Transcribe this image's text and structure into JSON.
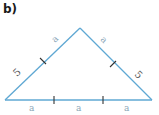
{
  "figure": {
    "part_label": "b)",
    "colors": {
      "line": "#5fa8d3",
      "tick": "#333333",
      "label_a": "#8aa6b8",
      "label_5": "#555555"
    },
    "triangle": {
      "apex": [
        80,
        28
      ],
      "base_left": [
        5,
        100
      ],
      "base_right": [
        152,
        100
      ]
    },
    "labels": {
      "left_upper": "a",
      "left_lower": "5",
      "right_upper": "a",
      "right_lower": "5",
      "base_left": "a",
      "base_middle": "a",
      "base_right": "a"
    }
  }
}
